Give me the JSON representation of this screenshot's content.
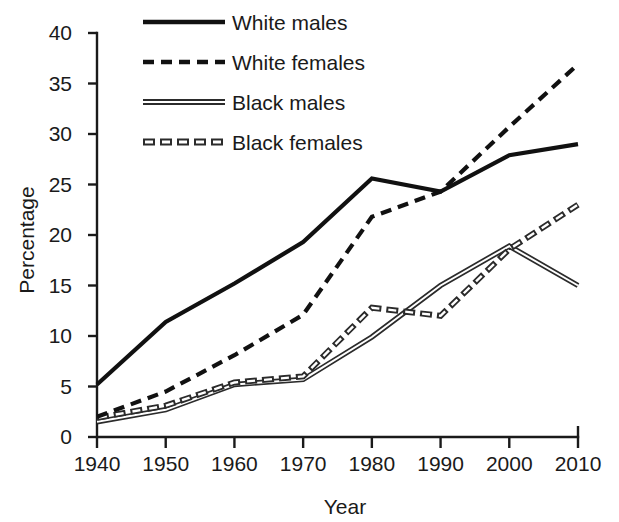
{
  "chart_data": {
    "type": "line",
    "title": "",
    "xlabel": "Year",
    "ylabel": "Percentage",
    "x": [
      1940,
      1950,
      1960,
      1970,
      1980,
      1990,
      2000,
      2010
    ],
    "categories": [
      "1940",
      "1950",
      "1960",
      "1970",
      "1980",
      "1990",
      "2000",
      "2010"
    ],
    "xlim": [
      1940,
      2010
    ],
    "ylim": [
      0,
      40
    ],
    "yticks": [
      0,
      5,
      10,
      15,
      20,
      25,
      30,
      35,
      40
    ],
    "ytick_labels": [
      "0",
      "5",
      "10",
      "15",
      "20",
      "25",
      "30",
      "35",
      "40"
    ],
    "xticks": [
      1940,
      1950,
      1960,
      1970,
      1980,
      1990,
      2000,
      2010
    ],
    "xtick_labels": [
      "1940",
      "1950",
      "1960",
      "1970",
      "1980",
      "1990",
      "2000",
      "2010"
    ],
    "grid": false,
    "legend_position": "top-center",
    "series": [
      {
        "name": "White males",
        "style": "solid",
        "values": [
          5.2,
          11.4,
          15.2,
          19.3,
          25.6,
          24.3,
          27.9,
          29.0
        ]
      },
      {
        "name": "White females",
        "style": "dashed",
        "values": [
          2.0,
          4.5,
          8.1,
          12.1,
          21.8,
          24.3,
          30.7,
          36.9
        ]
      },
      {
        "name": "Black males",
        "style": "double-solid",
        "values": [
          1.5,
          2.7,
          5.2,
          5.7,
          9.9,
          15.0,
          18.9,
          15.0
        ]
      },
      {
        "name": "Black females",
        "style": "double-dashed",
        "values": [
          1.9,
          3.1,
          5.4,
          6.0,
          12.8,
          12.0,
          18.6,
          23.0
        ]
      }
    ]
  },
  "legend": {
    "items": [
      {
        "label": "White males"
      },
      {
        "label": "White females"
      },
      {
        "label": "Black males"
      },
      {
        "label": "Black females"
      }
    ]
  },
  "axes": {
    "y_title": "Percentage",
    "x_title": "Year"
  }
}
